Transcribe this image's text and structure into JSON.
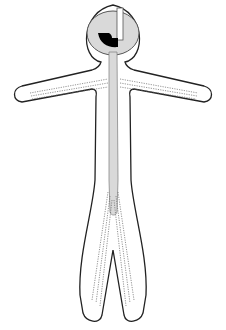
{
  "diagram": {
    "type": "figure-outline",
    "colors": {
      "outline": "#222222",
      "fill_channel": "#d9d9d9",
      "head_fill": "#d9d9d9",
      "marker": "#000000",
      "dots": "#666666",
      "background": "#ffffff"
    },
    "parts": [
      "head",
      "head-slot",
      "head-marker",
      "neck-channel",
      "left-arm",
      "right-arm",
      "torso",
      "left-leg",
      "right-leg"
    ]
  }
}
